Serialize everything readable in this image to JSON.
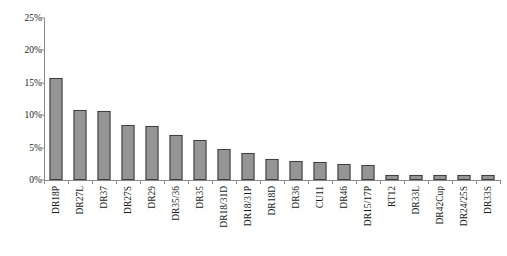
{
  "chart_data": {
    "type": "bar",
    "title": "",
    "subtitle": "",
    "xlabel": "",
    "ylabel": "",
    "ylim": [
      0,
      25
    ],
    "ytick_labels": [
      "0%",
      "5%",
      "10%",
      "15%",
      "20%",
      "25%"
    ],
    "ytick_values": [
      0,
      5,
      10,
      15,
      20,
      25
    ],
    "grid": false,
    "legend": false,
    "legend_position": "none",
    "bar_color": "#959595",
    "bar_edge_color": "#3d3d3d",
    "axis_color": "#8a8a8a",
    "text_color": "#1a1a1a",
    "background": "#ffffff",
    "value_suffix": "%",
    "categories": [
      "DR18P",
      "DR27L",
      "DR37",
      "DR27S",
      "DR29",
      "DR35/36",
      "DR35",
      "DR18/31D",
      "DR18/31P",
      "DR18D",
      "DR36",
      "CU11",
      "DR46",
      "DR15/17P",
      "RT12",
      "DR33L",
      "DR42Cup",
      "DR24/25S",
      "DR33S"
    ],
    "values": [
      15.8,
      10.8,
      10.6,
      8.5,
      8.3,
      7.0,
      6.2,
      4.8,
      4.2,
      3.3,
      3.0,
      2.8,
      2.5,
      2.3,
      0.7,
      0.7,
      0.7,
      0.7,
      0.7
    ]
  }
}
